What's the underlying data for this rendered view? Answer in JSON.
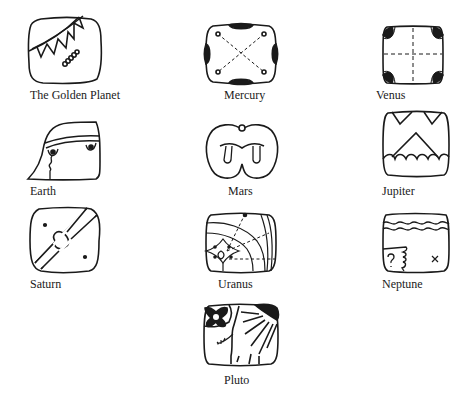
{
  "figure": {
    "stroke_color": "#1a1a1a",
    "background": "#ffffff",
    "glyphs": [
      {
        "id": "golden-planet",
        "label": "The Golden Planet"
      },
      {
        "id": "mercury",
        "label": "Mercury"
      },
      {
        "id": "venus",
        "label": "Venus"
      },
      {
        "id": "earth",
        "label": "Earth"
      },
      {
        "id": "mars",
        "label": "Mars"
      },
      {
        "id": "jupiter",
        "label": "Jupiter"
      },
      {
        "id": "saturn",
        "label": "Saturn"
      },
      {
        "id": "uranus",
        "label": "Uranus"
      },
      {
        "id": "neptune",
        "label": "Neptune"
      },
      {
        "id": "pluto",
        "label": "Pluto"
      }
    ]
  }
}
